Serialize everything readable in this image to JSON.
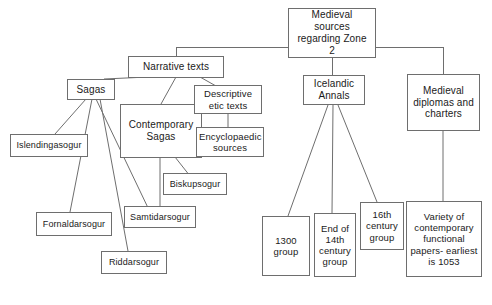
{
  "diagram": {
    "type": "tree-diagram",
    "title": "Medieval sources regarding Zone 2",
    "background_color": "#ffffff",
    "node_border_color": "#6e6e6e",
    "edge_color": "#6e6e6e",
    "text_color": "#1a1a1a",
    "nodes": {
      "root": "Medieval\nsources\nregarding Zone\n2",
      "narrative_texts": "Narrative texts",
      "sagas": "Sagas",
      "contemporary_sagas": "Contemporary\nSagas",
      "descriptive_etic_texts": "Descriptive\netic texts",
      "encyclopaedic_sources": "Encyclopaedic\nsources",
      "islendingasogur": "Islendingasogur",
      "fornaldarsogur": "Fornaldarsogur",
      "samtidarsogur": "Samtidarsogur",
      "riddarsogur": "Riddarsogur",
      "biskupsogur": "Biskupsogur",
      "icelandic_annals": "Icelandic\nAnnals",
      "group_1300": "1300\ngroup",
      "group_end_14th": "End of\n14th\ncentury\ngroup",
      "group_16th": "16th\ncentury\ngroup",
      "medieval_diplomas": "Medieval\ndiplomas and\ncharters",
      "variety_papers": "Variety of\ncontemporary\nfunctional\npapers- earliest\nis 1053"
    }
  }
}
